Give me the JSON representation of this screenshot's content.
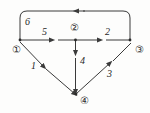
{
  "figure": {
    "type": "directed-graph-diagram",
    "background_color": "#fdfdfc",
    "stroke_color": "#3a3a3a",
    "text_color": "#1f1f1f",
    "width": 150,
    "height": 113
  },
  "nodes": [
    {
      "id": "1",
      "label": "①",
      "cx": 16,
      "cy": 50,
      "vertex_x": 20,
      "vertex_y": 40
    },
    {
      "id": "2",
      "label": "②",
      "cx": 74,
      "cy": 28,
      "vertex_x": 75,
      "vertex_y": 40
    },
    {
      "id": "3",
      "label": "③",
      "cx": 139,
      "cy": 50,
      "vertex_x": 130,
      "vertex_y": 40
    },
    {
      "id": "4",
      "label": "④",
      "cx": 84,
      "cy": 101,
      "vertex_x": 76,
      "vertex_y": 94
    }
  ],
  "edges": [
    {
      "name": "edge-3-to-1",
      "from": "3",
      "to": "1",
      "weight": "6",
      "shape": "curved-top",
      "arrow": "left",
      "label_x": 25,
      "label_y": 16
    },
    {
      "name": "edge-1-to-2",
      "from": "1",
      "to": "2",
      "weight": "5",
      "shape": "straight",
      "arrow": "right",
      "label_x": 42,
      "label_y": 26
    },
    {
      "name": "edge-2-to-3",
      "from": "2",
      "to": "3",
      "weight": "2",
      "shape": "straight",
      "arrow": "right",
      "label_x": 105,
      "label_y": 26
    },
    {
      "name": "edge-1-to-4",
      "from": "1",
      "to": "4",
      "weight": "1",
      "shape": "straight",
      "arrow": "down-right",
      "label_x": 31,
      "label_y": 60
    },
    {
      "name": "edge-2-to-4",
      "from": "2",
      "to": "4",
      "weight": "4",
      "shape": "straight",
      "arrow": "down",
      "label_x": 80,
      "label_y": 55
    },
    {
      "name": "edge-4-to-3",
      "from": "4",
      "to": "3",
      "weight": "3",
      "shape": "straight",
      "arrow": "up-right",
      "label_x": 107,
      "label_y": 68
    }
  ],
  "node_labels": {
    "n1": "①",
    "n2": "②",
    "n3": "③",
    "n4": "④"
  },
  "weights": {
    "w6": "6",
    "w5": "5",
    "w2": "2",
    "w1": "1",
    "w4": "4",
    "w3": "3"
  }
}
